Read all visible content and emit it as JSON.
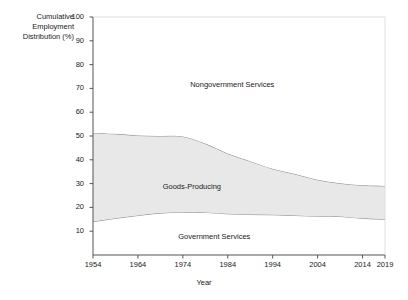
{
  "chart_data": {
    "type": "area",
    "title": "",
    "xlabel": "Year",
    "ylabel": "Cumulative\nEmployment\nDistribution (%)",
    "xlim": [
      1954,
      2019
    ],
    "ylim": [
      0,
      100
    ],
    "grid": false,
    "legend_position": "inline-labels",
    "stacked": true,
    "x": [
      1954,
      1959,
      1964,
      1969,
      1974,
      1979,
      1984,
      1989,
      1994,
      1999,
      2004,
      2009,
      2014,
      2019
    ],
    "xticks": [
      1954,
      1964,
      1974,
      1984,
      1994,
      2004,
      2014,
      2019
    ],
    "xtick_labels": [
      "1954",
      "1964",
      "1974",
      "1984",
      "1994",
      "2004",
      "2014",
      "2019"
    ],
    "yticks": [
      10,
      20,
      30,
      40,
      50,
      60,
      70,
      80,
      90,
      100
    ],
    "ytick_labels": [
      "10",
      "20",
      "30",
      "40",
      "50",
      "60",
      "70",
      "80",
      "90",
      "100"
    ],
    "series": [
      {
        "name": "Government Services",
        "fill": "#ffffff",
        "cumulative_top": [
          14.0,
          15.4,
          16.6,
          17.6,
          18.0,
          17.9,
          17.3,
          17.0,
          16.9,
          16.6,
          16.3,
          16.2,
          15.4,
          15.0
        ],
        "values": [
          14.0,
          15.4,
          16.6,
          17.6,
          18.0,
          17.9,
          17.3,
          17.0,
          16.9,
          16.6,
          16.3,
          16.2,
          15.4,
          15.0
        ]
      },
      {
        "name": "Goods-Producing",
        "fill": "#e8e8e8",
        "cumulative_top": [
          51.2,
          50.9,
          50.2,
          50.0,
          49.8,
          46.8,
          42.6,
          39.4,
          36.2,
          34.0,
          31.6,
          30.1,
          29.3,
          29.0
        ],
        "values": [
          37.2,
          35.5,
          33.6,
          32.4,
          31.8,
          28.9,
          25.3,
          22.4,
          19.3,
          17.4,
          15.3,
          13.9,
          13.9,
          14.0
        ]
      },
      {
        "name": "Nongovernment Services",
        "fill": "#ffffff",
        "cumulative_top": [
          100,
          100,
          100,
          100,
          100,
          100,
          100,
          100,
          100,
          100,
          100,
          100,
          100,
          100
        ],
        "values": [
          48.8,
          49.1,
          49.8,
          50.0,
          50.2,
          53.2,
          57.4,
          60.6,
          63.8,
          66.0,
          68.4,
          69.9,
          70.7,
          71.0
        ]
      }
    ],
    "annotations": [
      {
        "text": "Nongovernment Services",
        "x": 1985,
        "y": 72
      },
      {
        "text": "Goods-Producing",
        "x": 1976,
        "y": 29
      },
      {
        "text": "Government Services",
        "x": 1981,
        "y": 8
      }
    ],
    "colors": {
      "band_shaded": "#e8e8e8",
      "band_plain": "#ffffff",
      "line": "#808080",
      "axis": "#555555",
      "text": "#1a1a1a"
    }
  }
}
